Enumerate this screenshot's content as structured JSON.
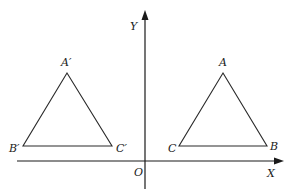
{
  "diagram": {
    "axes": {
      "x_label": "X",
      "y_label": "Y",
      "origin_label": "O"
    },
    "triangles": [
      {
        "name": "ABC",
        "side": "right",
        "vertices": [
          {
            "id": "A",
            "label": "A",
            "role": "apex"
          },
          {
            "id": "B",
            "label": "B",
            "role": "base-right"
          },
          {
            "id": "C",
            "label": "C",
            "role": "base-left"
          }
        ]
      },
      {
        "name": "A'B'C'",
        "side": "left",
        "vertices": [
          {
            "id": "A'",
            "label": "A′",
            "role": "apex"
          },
          {
            "id": "B'",
            "label": "B′",
            "role": "base-left"
          },
          {
            "id": "C'",
            "label": "C′",
            "role": "base-right"
          }
        ]
      }
    ],
    "colors": {
      "line": "#1a1a1a",
      "background": "#ffffff"
    }
  }
}
